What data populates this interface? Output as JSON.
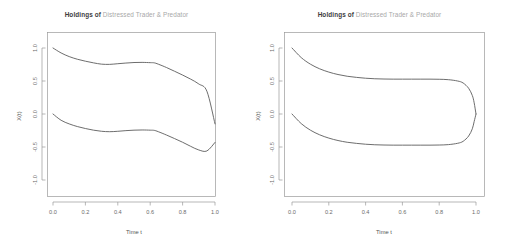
{
  "figure": {
    "background_color": "#ffffff",
    "panels": [
      {
        "name": "left-panel",
        "title_strong": "Holdings of ",
        "title_light": "Distressed Trader & Predator",
        "xlabel": "Time t",
        "ylabel": "X(t)"
      },
      {
        "name": "right-panel",
        "title_strong": "Holdings of ",
        "title_light": "Distressed Trader & Predator",
        "xlabel": "Time t",
        "ylabel": "X(t)"
      }
    ],
    "colors": {
      "title_strong": "#3d3d3d",
      "title_light": "#a8a8a8",
      "curve": "#5c5c5c",
      "axis": "#9a9a9a",
      "tick_text": "#6b6b6b"
    }
  },
  "chart_data": [
    {
      "type": "line",
      "title": "Holdings of Distressed Trader & Predator",
      "xlabel": "Time t",
      "ylabel": "X(t)",
      "xlim": [
        -0.04,
        1.04
      ],
      "ylim": [
        -1.25,
        1.25
      ],
      "xticks": [
        0.0,
        0.2,
        0.4,
        0.6,
        0.8,
        1.0
      ],
      "xticklabels": [
        "0.0",
        "0.2",
        "0.4",
        "0.6",
        "0.8",
        "1.0"
      ],
      "yticks": [
        -1.0,
        -0.5,
        0.0,
        0.5,
        1.0
      ],
      "yticklabels": [
        "-1.0",
        "-0.5",
        "0.0",
        "0.5",
        "1.0"
      ],
      "grid": false,
      "legend": "none",
      "x": [
        0.0,
        0.05,
        0.1,
        0.15,
        0.2,
        0.25,
        0.3,
        0.35,
        0.4,
        0.45,
        0.5,
        0.55,
        0.6,
        0.625,
        0.65,
        0.7,
        0.75,
        0.8,
        0.85,
        0.9,
        0.95,
        1.0
      ],
      "series": [
        {
          "name": "Distressed Trader",
          "values": [
            1.0,
            0.925,
            0.87,
            0.83,
            0.8,
            0.775,
            0.755,
            0.752,
            0.762,
            0.772,
            0.78,
            0.782,
            0.778,
            0.775,
            0.755,
            0.705,
            0.648,
            0.59,
            0.528,
            0.455,
            0.345,
            -0.15
          ]
        },
        {
          "name": "Predator",
          "values": [
            0.0,
            -0.095,
            -0.15,
            -0.19,
            -0.22,
            -0.245,
            -0.262,
            -0.268,
            -0.262,
            -0.252,
            -0.245,
            -0.242,
            -0.245,
            -0.248,
            -0.268,
            -0.318,
            -0.372,
            -0.428,
            -0.49,
            -0.545,
            -0.56,
            -0.43
          ]
        }
      ]
    },
    {
      "type": "line",
      "title": "Holdings of Distressed Trader & Predator",
      "xlabel": "Time t",
      "ylabel": "X(t)",
      "xlim": [
        -0.04,
        1.04
      ],
      "ylim": [
        -1.25,
        1.25
      ],
      "xticks": [
        0.0,
        0.2,
        0.4,
        0.6,
        0.8,
        1.0
      ],
      "xticklabels": [
        "0.0",
        "0.2",
        "0.4",
        "0.6",
        "0.8",
        "1.0"
      ],
      "yticks": [
        -1.0,
        -0.5,
        0.0,
        0.5,
        1.0
      ],
      "yticklabels": [
        "-1.0",
        "-0.5",
        "0.0",
        "0.5",
        "1.0"
      ],
      "grid": false,
      "legend": "none",
      "x": [
        0.0,
        0.05,
        0.1,
        0.15,
        0.2,
        0.25,
        0.3,
        0.35,
        0.4,
        0.45,
        0.5,
        0.55,
        0.6,
        0.65,
        0.7,
        0.75,
        0.8,
        0.85,
        0.9,
        0.93,
        0.96,
        0.98,
        0.99,
        1.0
      ],
      "series": [
        {
          "name": "Distressed Trader",
          "values": [
            1.0,
            0.855,
            0.755,
            0.685,
            0.635,
            0.598,
            0.572,
            0.555,
            0.542,
            0.534,
            0.53,
            0.528,
            0.528,
            0.528,
            0.528,
            0.528,
            0.526,
            0.52,
            0.5,
            0.47,
            0.39,
            0.28,
            0.17,
            0.0
          ]
        },
        {
          "name": "Predator",
          "values": [
            0.0,
            -0.145,
            -0.245,
            -0.315,
            -0.365,
            -0.402,
            -0.428,
            -0.445,
            -0.458,
            -0.466,
            -0.47,
            -0.472,
            -0.472,
            -0.472,
            -0.472,
            -0.472,
            -0.47,
            -0.464,
            -0.444,
            -0.414,
            -0.334,
            -0.224,
            -0.114,
            0.0
          ]
        }
      ]
    }
  ]
}
